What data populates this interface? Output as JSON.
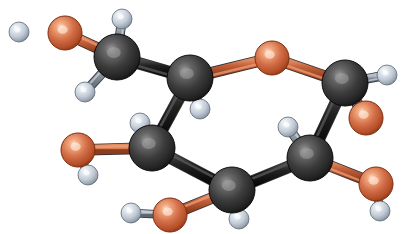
{
  "figure": {
    "kind": "ball-and-stick-molecular-model",
    "molecule_name": "glucose",
    "background_color": "#ffffff",
    "width": 409,
    "height": 234
  },
  "palette": {
    "carbon_base": "#3a3a3a",
    "carbon_highlight": "#8d8d8d",
    "carbon_edge": "#151515",
    "oxygen_base": "#cf6a42",
    "oxygen_highlight": "#f0b394",
    "oxygen_edge": "#8c3415",
    "hydrogen_base": "#c3ccd7",
    "hydrogen_highlight": "#f2f5f8",
    "hydrogen_edge": "#6f7b88",
    "bond_carbon_carbon": "#1c1c1c",
    "bond_carbon_oxygen": "#c4603a",
    "bond_carbon_hydrogen": "#8f98a3"
  },
  "chart_data": {
    "type": "scatter",
    "xlabel": "",
    "ylabel": "",
    "xlim": [
      0,
      409
    ],
    "ylim": [
      0,
      234
    ],
    "grid": false,
    "legend": "none",
    "series": [
      {
        "name": "carbon",
        "element": "C",
        "color": "#3a3a3a",
        "radius": 23,
        "points": [
          {
            "id": "C6",
            "label": "C6",
            "x": 117,
            "y": 57
          },
          {
            "id": "C5",
            "label": "C5",
            "x": 190,
            "y": 78
          },
          {
            "id": "C1",
            "label": "C1",
            "x": 345,
            "y": 83
          },
          {
            "id": "C4",
            "label": "C4",
            "x": 152,
            "y": 148
          },
          {
            "id": "C2",
            "label": "C2",
            "x": 310,
            "y": 158
          },
          {
            "id": "C3",
            "label": "C3",
            "x": 232,
            "y": 190
          }
        ]
      },
      {
        "name": "oxygen",
        "element": "O",
        "color": "#cf6a42",
        "radius": 17,
        "points": [
          {
            "id": "O6",
            "label": "O6 hydroxyl",
            "x": 65,
            "y": 33
          },
          {
            "id": "O5",
            "label": "O5 ring",
            "x": 272,
            "y": 58
          },
          {
            "id": "O1",
            "label": "O1 hydroxyl",
            "x": 366,
            "y": 118
          },
          {
            "id": "O4",
            "label": "O4 hydroxyl",
            "x": 78,
            "y": 150
          },
          {
            "id": "O2",
            "label": "O2 hydroxyl",
            "x": 376,
            "y": 184
          },
          {
            "id": "O3",
            "label": "O3 hydroxyl",
            "x": 170,
            "y": 215
          }
        ]
      },
      {
        "name": "hydrogen",
        "element": "H",
        "color": "#c3ccd7",
        "radius": 10,
        "points": [
          {
            "id": "H_O6",
            "label": "H on O6",
            "x": 19,
            "y": 32
          },
          {
            "id": "H6a",
            "label": "H on C6 up",
            "x": 122,
            "y": 19
          },
          {
            "id": "H6b",
            "label": "H on C6 down-left",
            "x": 85,
            "y": 92
          },
          {
            "id": "H5",
            "label": "H on C5",
            "x": 200,
            "y": 109
          },
          {
            "id": "H1",
            "label": "H on C1",
            "x": 387,
            "y": 75
          },
          {
            "id": "H_O1",
            "label": "H on O1",
            "x": 350,
            "y": 95
          },
          {
            "id": "H4",
            "label": "H on C4",
            "x": 140,
            "y": 123
          },
          {
            "id": "H_O4",
            "label": "H on O4",
            "x": 88,
            "y": 175
          },
          {
            "id": "H2",
            "label": "H on C2",
            "x": 288,
            "y": 127
          },
          {
            "id": "H_O2",
            "label": "H on O2",
            "x": 380,
            "y": 211
          },
          {
            "id": "H3",
            "label": "H on C3",
            "x": 239,
            "y": 219
          },
          {
            "id": "H_O3",
            "label": "H on O3",
            "x": 131,
            "y": 213
          }
        ]
      }
    ],
    "bonds": [
      {
        "from": "C6",
        "to": "O6",
        "kind": "C-O"
      },
      {
        "from": "C6",
        "to": "H6a",
        "kind": "C-H"
      },
      {
        "from": "C6",
        "to": "H6b",
        "kind": "C-H"
      },
      {
        "from": "C6",
        "to": "C5",
        "kind": "C-C"
      },
      {
        "from": "C5",
        "to": "O5",
        "kind": "C-O"
      },
      {
        "from": "C5",
        "to": "H5",
        "kind": "C-H"
      },
      {
        "from": "C5",
        "to": "C4",
        "kind": "C-C"
      },
      {
        "from": "O5",
        "to": "C1",
        "kind": "C-O"
      },
      {
        "from": "C1",
        "to": "H1",
        "kind": "C-H"
      },
      {
        "from": "C1",
        "to": "O1",
        "kind": "C-O"
      },
      {
        "from": "O1",
        "to": "H_O1",
        "kind": "O-H"
      },
      {
        "from": "C1",
        "to": "C2",
        "kind": "C-C"
      },
      {
        "from": "C2",
        "to": "H2",
        "kind": "C-H"
      },
      {
        "from": "C2",
        "to": "O2",
        "kind": "C-O"
      },
      {
        "from": "O2",
        "to": "H_O2",
        "kind": "O-H"
      },
      {
        "from": "C2",
        "to": "C3",
        "kind": "C-C"
      },
      {
        "from": "C3",
        "to": "H3",
        "kind": "C-H"
      },
      {
        "from": "C3",
        "to": "O3",
        "kind": "C-O"
      },
      {
        "from": "O3",
        "to": "H_O3",
        "kind": "O-H"
      },
      {
        "from": "C3",
        "to": "C4",
        "kind": "C-C"
      },
      {
        "from": "C4",
        "to": "H4",
        "kind": "C-H"
      },
      {
        "from": "C4",
        "to": "O4",
        "kind": "C-O"
      },
      {
        "from": "O4",
        "to": "H_O4",
        "kind": "O-H"
      }
    ],
    "draw_order": [
      "H_O6",
      "H6a",
      "H6b",
      "H5",
      "H4",
      "H_O4",
      "H3",
      "H_O3",
      "H2",
      "H_O2",
      "H_O1",
      "H1",
      "O6",
      "O5",
      "O4",
      "O3",
      "O1",
      "O2",
      "C6",
      "C5",
      "C4",
      "C3",
      "C2",
      "C1"
    ]
  }
}
